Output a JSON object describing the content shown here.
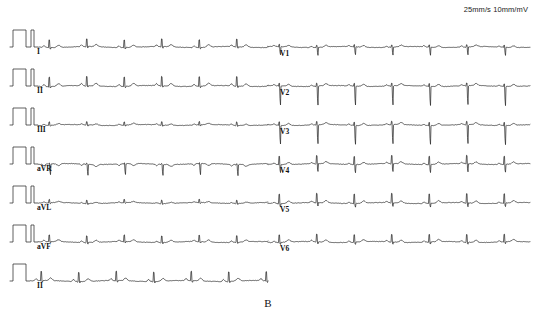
{
  "figure": {
    "panel_label": "B",
    "calibration_text": "25mm/s 10mm/mV",
    "background_color": "#ffffff",
    "trace_color": "#2b2b2b"
  },
  "chart_data": {
    "type": "line",
    "subtitle": "B",
    "xlabel": "",
    "ylabel": "",
    "grid": false,
    "legend_position": "inline-left",
    "paper_speed": "25mm/s",
    "gain": "10mm/mV",
    "layout": "3x4 plus rhythm strip",
    "columns": 2,
    "rows": 7,
    "beat_interval_px": 37.5,
    "beats_per_row": 14,
    "annotations": [
      {
        "text": "25mm/s 10mm/mV",
        "x": 458,
        "y": 12
      },
      {
        "text": "B",
        "x": 268,
        "y": 300
      }
    ],
    "series": [
      {
        "name": "I",
        "label": "I",
        "column": "left",
        "row": 0,
        "baseline_y": 47,
        "calibration": "double",
        "r_amplitude": 14,
        "s_amplitude": 2,
        "p_amplitude": 1.6,
        "t_amplitude": 2.2,
        "polarity": "positive",
        "label_x": 37,
        "label_y": 48
      },
      {
        "name": "II",
        "label": "II",
        "column": "left",
        "row": 1,
        "baseline_y": 86,
        "calibration": "double",
        "r_amplitude": 17,
        "s_amplitude": 2,
        "p_amplitude": 2.0,
        "t_amplitude": 2.6,
        "polarity": "positive",
        "label_x": 37,
        "label_y": 87
      },
      {
        "name": "III",
        "label": "III",
        "column": "left",
        "row": 2,
        "baseline_y": 125,
        "calibration": "double",
        "r_amplitude": 6,
        "s_amplitude": 1.5,
        "p_amplitude": 1.0,
        "t_amplitude": 1.4,
        "polarity": "positive",
        "label_x": 37,
        "label_y": 126
      },
      {
        "name": "aVR",
        "label": "aVR",
        "column": "left",
        "row": 3,
        "baseline_y": 164,
        "calibration": "double",
        "r_amplitude": 1.5,
        "s_amplitude": 15,
        "p_amplitude": -1.6,
        "t_amplitude": -2.0,
        "polarity": "negative",
        "label_x": 37,
        "label_y": 165
      },
      {
        "name": "aVL",
        "label": "aVL",
        "column": "left",
        "row": 4,
        "baseline_y": 203,
        "calibration": "double",
        "r_amplitude": 6,
        "s_amplitude": 1.5,
        "p_amplitude": 0.8,
        "t_amplitude": 1.2,
        "polarity": "positive",
        "label_x": 37,
        "label_y": 204
      },
      {
        "name": "aVF",
        "label": "aVF",
        "column": "left",
        "row": 5,
        "baseline_y": 242,
        "calibration": "double",
        "r_amplitude": 12,
        "s_amplitude": 2,
        "p_amplitude": 1.4,
        "t_amplitude": 2.0,
        "polarity": "positive",
        "label_x": 37,
        "label_y": 243
      },
      {
        "name": "II-rhythm",
        "label": "II",
        "column": "left",
        "row": 6,
        "baseline_y": 281,
        "calibration": "single",
        "r_amplitude": 17,
        "s_amplitude": 2,
        "p_amplitude": 2.0,
        "t_amplitude": 2.6,
        "polarity": "positive",
        "label_x": 37,
        "label_y": 282
      },
      {
        "name": "V1",
        "label": "V1",
        "column": "right",
        "row": 0,
        "baseline_y": 47,
        "calibration": "none",
        "r_amplitude": 4,
        "s_amplitude": 11,
        "p_amplitude": 1.2,
        "t_amplitude": 1.6,
        "polarity": "biphasic",
        "label_x": 280,
        "label_y": 50
      },
      {
        "name": "V2",
        "label": "V2",
        "column": "right",
        "row": 1,
        "baseline_y": 86,
        "calibration": "none",
        "r_amplitude": 5,
        "s_amplitude": 26,
        "p_amplitude": 1.2,
        "t_amplitude": 2.0,
        "polarity": "biphasic",
        "label_x": 280,
        "label_y": 89
      },
      {
        "name": "V3",
        "label": "V3",
        "column": "right",
        "row": 2,
        "baseline_y": 125,
        "calibration": "none",
        "r_amplitude": 6,
        "s_amplitude": 26,
        "p_amplitude": 1.2,
        "t_amplitude": 2.0,
        "polarity": "biphasic",
        "label_x": 280,
        "label_y": 128
      },
      {
        "name": "V4",
        "label": "V4",
        "column": "right",
        "row": 3,
        "baseline_y": 164,
        "calibration": "none",
        "r_amplitude": 15,
        "s_amplitude": 11,
        "p_amplitude": 1.2,
        "t_amplitude": 2.0,
        "polarity": "positive",
        "label_x": 280,
        "label_y": 167
      },
      {
        "name": "V5",
        "label": "V5",
        "column": "right",
        "row": 4,
        "baseline_y": 203,
        "calibration": "none",
        "r_amplitude": 17,
        "s_amplitude": 5,
        "p_amplitude": 1.3,
        "t_amplitude": 2.2,
        "polarity": "positive",
        "label_x": 280,
        "label_y": 206
      },
      {
        "name": "V6",
        "label": "V6",
        "column": "right",
        "row": 5,
        "baseline_y": 242,
        "calibration": "none",
        "r_amplitude": 14,
        "s_amplitude": 3,
        "p_amplitude": 1.3,
        "t_amplitude": 2.2,
        "polarity": "positive",
        "label_x": 280,
        "label_y": 245
      }
    ]
  }
}
